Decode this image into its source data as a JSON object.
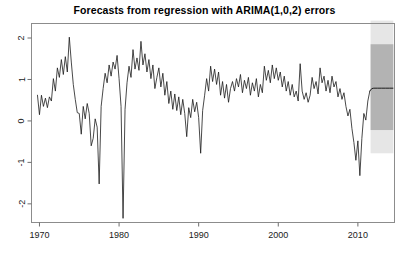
{
  "chart_data": {
    "type": "line",
    "title": "Forecasts from regression with ARIMA(1,0,2) errors",
    "xlabel": "",
    "ylabel": "",
    "xlim": [
      1969.0,
      2014.6
    ],
    "ylim": [
      -2.45,
      2.35
    ],
    "grid": false,
    "legend": false,
    "xticks": [
      1970,
      1980,
      1990,
      2000,
      2010
    ],
    "xtick_labels": [
      "1970",
      "1980",
      "1990",
      "2000",
      "2010"
    ],
    "yticks": [
      -2,
      -1,
      0,
      1,
      2
    ],
    "ytick_labels": [
      "-2",
      "-1",
      "0",
      "1",
      "2"
    ],
    "ytick_label_rotation": 90,
    "series": [
      {
        "name": "historical",
        "color": "#1a1a1a",
        "linewidth": 0.8,
        "x": [
          1969.75,
          1970.0,
          1970.25,
          1970.5,
          1970.75,
          1971.0,
          1971.25,
          1971.5,
          1971.75,
          1972.0,
          1972.25,
          1972.5,
          1972.75,
          1973.0,
          1973.25,
          1973.5,
          1973.75,
          1974.0,
          1974.25,
          1974.5,
          1974.75,
          1975.0,
          1975.25,
          1975.5,
          1975.75,
          1976.0,
          1976.25,
          1976.5,
          1976.75,
          1977.0,
          1977.25,
          1977.5,
          1977.75,
          1978.0,
          1978.25,
          1978.5,
          1978.75,
          1979.0,
          1979.25,
          1979.5,
          1979.75,
          1980.0,
          1980.25,
          1980.5,
          1980.75,
          1981.0,
          1981.25,
          1981.5,
          1981.75,
          1982.0,
          1982.25,
          1982.5,
          1982.75,
          1983.0,
          1983.25,
          1983.5,
          1983.75,
          1984.0,
          1984.25,
          1984.5,
          1984.75,
          1985.0,
          1985.25,
          1985.5,
          1985.75,
          1986.0,
          1986.25,
          1986.5,
          1986.75,
          1987.0,
          1987.25,
          1987.5,
          1987.75,
          1988.0,
          1988.25,
          1988.5,
          1988.75,
          1989.0,
          1989.25,
          1989.5,
          1989.75,
          1990.0,
          1990.25,
          1990.5,
          1990.75,
          1991.0,
          1991.25,
          1991.5,
          1991.75,
          1992.0,
          1992.25,
          1992.5,
          1992.75,
          1993.0,
          1993.25,
          1993.5,
          1993.75,
          1994.0,
          1994.25,
          1994.5,
          1994.75,
          1995.0,
          1995.25,
          1995.5,
          1995.75,
          1996.0,
          1996.25,
          1996.5,
          1996.75,
          1997.0,
          1997.25,
          1997.5,
          1997.75,
          1998.0,
          1998.25,
          1998.5,
          1998.75,
          1999.0,
          1999.25,
          1999.5,
          1999.75,
          2000.0,
          2000.25,
          2000.5,
          2000.75,
          2001.0,
          2001.25,
          2001.5,
          2001.75,
          2002.0,
          2002.25,
          2002.5,
          2002.75,
          2003.0,
          2003.25,
          2003.5,
          2003.75,
          2004.0,
          2004.25,
          2004.5,
          2004.75,
          2005.0,
          2005.25,
          2005.5,
          2005.75,
          2006.0,
          2006.25,
          2006.5,
          2006.75,
          2007.0,
          2007.25,
          2007.5,
          2007.75,
          2008.0,
          2008.25,
          2008.5,
          2008.75,
          2009.0,
          2009.25,
          2009.5,
          2009.75,
          2010.0,
          2010.25,
          2010.5,
          2010.75,
          2011.0,
          2011.25,
          2011.5
        ],
        "y": [
          0.62,
          0.15,
          0.62,
          0.35,
          0.55,
          0.32,
          0.58,
          0.48,
          1.02,
          0.72,
          1.28,
          1.05,
          1.48,
          1.12,
          1.55,
          1.18,
          2.02,
          1.42,
          0.88,
          0.52,
          0.2,
          0.18,
          -0.32,
          0.35,
          0.05,
          0.42,
          0.18,
          -0.6,
          -0.42,
          0.05,
          -0.15,
          -1.52,
          0.35,
          0.78,
          1.15,
          0.92,
          1.35,
          1.08,
          1.42,
          1.25,
          1.58,
          1.02,
          0.35,
          -2.35,
          0.28,
          0.92,
          1.32,
          1.05,
          1.72,
          1.25,
          1.52,
          1.22,
          1.92,
          1.35,
          1.62,
          1.18,
          1.48,
          1.02,
          1.35,
          0.78,
          1.05,
          1.28,
          0.82,
          1.15,
          0.62,
          0.95,
          0.42,
          0.72,
          0.28,
          0.65,
          0.25,
          0.58,
          0.15,
          0.52,
          0.18,
          -0.38,
          0.32,
          0.08,
          0.52,
          0.22,
          0.45,
          0.08,
          -0.78,
          0.25,
          0.62,
          1.02,
          0.72,
          1.32,
          0.95,
          1.25,
          0.88,
          1.18,
          0.62,
          0.95,
          0.55,
          0.88,
          0.45,
          0.78,
          0.95,
          0.72,
          1.02,
          0.82,
          1.12,
          0.68,
          0.98,
          0.78,
          1.05,
          0.62,
          0.92,
          0.72,
          1.02,
          0.58,
          0.88,
          0.68,
          1.32,
          0.98,
          1.22,
          0.92,
          1.35,
          1.02,
          1.28,
          0.98,
          1.18,
          0.82,
          1.08,
          0.72,
          0.95,
          0.62,
          0.88,
          0.58,
          0.72,
          0.48,
          1.38,
          0.72,
          0.52,
          0.68,
          0.45,
          0.62,
          1.05,
          0.78,
          0.95,
          0.65,
          1.28,
          0.92,
          1.08,
          0.72,
          0.98,
          0.68,
          1.08,
          0.82,
          0.95,
          0.58,
          0.78,
          0.52,
          0.68,
          0.35,
          0.12,
          0.28,
          -0.18,
          -0.52,
          -0.95,
          -0.48,
          -1.32,
          -0.42,
          0.18,
          0.02,
          0.48,
          0.72
        ]
      },
      {
        "name": "forecast_mean",
        "color": "#1a1a1a",
        "linewidth": 1.0,
        "x": [
          2011.5,
          2011.75,
          2012.0,
          2012.5,
          2013.0,
          2013.5,
          2014.0,
          2014.4
        ],
        "y": [
          0.72,
          0.78,
          0.79,
          0.79,
          0.79,
          0.79,
          0.79,
          0.79
        ]
      }
    ],
    "prediction_intervals": [
      {
        "name": "95% prediction interval",
        "level": 95,
        "color": "#e6e6e6",
        "x_start": 2011.6,
        "x_end": 2014.45,
        "lower": -0.78,
        "upper": 2.42
      },
      {
        "name": "80% prediction interval",
        "level": 80,
        "color": "#b3b3b3",
        "x_start": 2011.6,
        "x_end": 2014.45,
        "lower": -0.22,
        "upper": 1.85
      }
    ]
  },
  "axes": {
    "frame_color": "#8c8c8c",
    "tick_color": "#6e6e6e"
  }
}
